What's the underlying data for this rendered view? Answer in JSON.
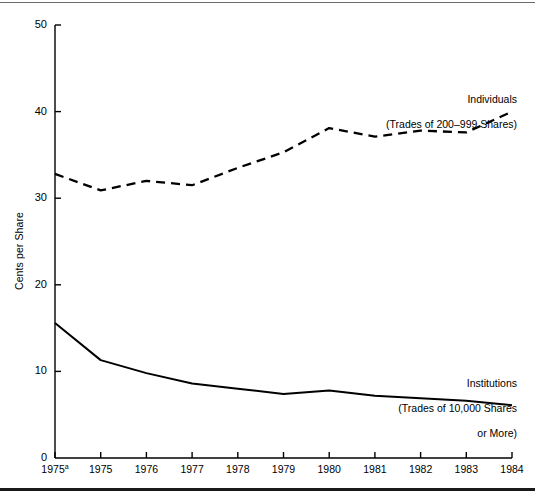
{
  "figure": {
    "background_color": "#ffffff",
    "line_color": "#000000",
    "rule_color_top": "#6b6b6b",
    "rule_color_bottom": "#1a1a1a"
  },
  "annotations": {
    "individuals": {
      "line1": "Individuals",
      "line2": "(Trades of 200–999 Shares)"
    },
    "institutions": {
      "line1": "Institutions",
      "line2": "(Trades of 10,000 Shares",
      "line3": "or More)"
    }
  },
  "chart_data": {
    "type": "line",
    "title": "",
    "xlabel": "",
    "ylabel": "Cents per Share",
    "categories": [
      "1975ᵃ",
      "1975",
      "1976",
      "1977",
      "1978",
      "1979",
      "1980",
      "1981",
      "1982",
      "1983",
      "1984"
    ],
    "x_tick_labels": [
      "1975",
      "1975",
      "1976",
      "1977",
      "1978",
      "1979",
      "1980",
      "1981",
      "1982",
      "1983",
      "1984"
    ],
    "x_tick_superscripts": [
      "a",
      "",
      "",
      "",
      "",
      "",
      "",
      "",
      "",
      "",
      ""
    ],
    "y_ticks": [
      0,
      10,
      20,
      30,
      40,
      50
    ],
    "y_tick_labels": [
      "0",
      "10",
      "20",
      "30",
      "40",
      "50"
    ],
    "ylim": [
      0,
      50
    ],
    "grid": false,
    "legend_position": "inline-annotation",
    "series": [
      {
        "name": "Individuals (Trades of 200–999 Shares)",
        "style": "dashed",
        "color": "#000000",
        "values": [
          32.8,
          30.9,
          32.0,
          31.5,
          33.5,
          35.3,
          38.1,
          37.1,
          37.8,
          37.6,
          40.0
        ]
      },
      {
        "name": "Institutions (Trades of 10,000 Shares or More)",
        "style": "solid",
        "color": "#000000",
        "values": [
          15.6,
          11.3,
          9.8,
          8.6,
          8.0,
          7.4,
          7.8,
          7.2,
          6.9,
          6.6,
          6.1
        ]
      }
    ]
  }
}
